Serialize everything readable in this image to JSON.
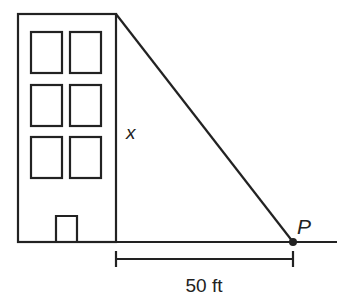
{
  "diagram": {
    "type": "geometry-word-problem",
    "labels": {
      "height": "x",
      "point": "P",
      "distance": "50 ft"
    },
    "building": {
      "windows_rows": 3,
      "windows_cols": 2,
      "has_door": true
    },
    "colors": {
      "stroke": "#222222",
      "background": "#ffffff"
    }
  }
}
